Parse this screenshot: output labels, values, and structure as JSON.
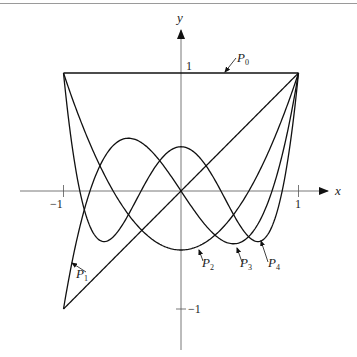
{
  "chart_data": {
    "type": "line",
    "title": "",
    "xlabel": "x",
    "ylabel": "y",
    "xlim": [
      -1,
      1
    ],
    "ylim": [
      -1,
      1
    ],
    "x_ticks": [
      "-1",
      "1"
    ],
    "y_ticks": [
      "1",
      "-1"
    ],
    "grid": false,
    "legend": "inline annotations with arrows",
    "series": [
      {
        "name": "P0",
        "label": "P",
        "sub": "0",
        "formula": "1",
        "x": [
          -1,
          -0.5,
          0,
          0.5,
          1
        ],
        "values": [
          1,
          1,
          1,
          1,
          1
        ]
      },
      {
        "name": "P1",
        "label": "P",
        "sub": "1",
        "formula": "x",
        "x": [
          -1,
          -0.5,
          0,
          0.5,
          1
        ],
        "values": [
          -1,
          -0.5,
          0,
          0.5,
          1
        ]
      },
      {
        "name": "P2",
        "label": "P",
        "sub": "2",
        "formula": "(3x^2-1)/2",
        "x": [
          -1,
          -0.5,
          0,
          0.5,
          1
        ],
        "values": [
          1,
          -0.125,
          -0.5,
          -0.125,
          1
        ]
      },
      {
        "name": "P3",
        "label": "P",
        "sub": "3",
        "formula": "(5x^3-3x)/2",
        "x": [
          -1,
          -0.5,
          0,
          0.5,
          1
        ],
        "values": [
          -1,
          0.4375,
          0,
          -0.4375,
          1
        ]
      },
      {
        "name": "P4",
        "label": "P",
        "sub": "4",
        "formula": "(35x^4-30x^2+3)/8",
        "x": [
          -1,
          -0.5,
          0,
          0.5,
          1
        ],
        "values": [
          1,
          -0.2891,
          0.375,
          -0.2891,
          1
        ]
      }
    ]
  },
  "axes": {
    "x_label": "x",
    "y_label": "y",
    "x_tick_neg": "−1",
    "x_tick_pos": "1",
    "y_tick_pos": "1",
    "y_tick_neg": "−1"
  },
  "annotations": {
    "p0": {
      "main": "P",
      "sub": "0"
    },
    "p1": {
      "main": "P",
      "sub": "1"
    },
    "p2": {
      "main": "P",
      "sub": "2"
    },
    "p3": {
      "main": "P",
      "sub": "3"
    },
    "p4": {
      "main": "P",
      "sub": "4"
    }
  }
}
